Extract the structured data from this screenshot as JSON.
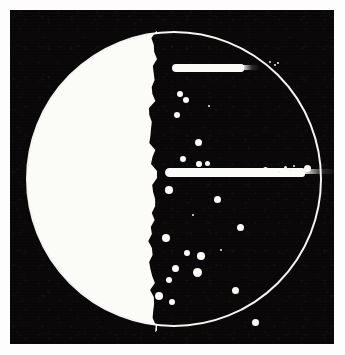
{
  "image": {
    "kind": "photograph",
    "subject": "microbiology culture plate",
    "description": "Black-and-white photograph of a circular culture plate showing a confluent white bacterial lawn over the left half, two horizontal inoculation streaks, and numerous discrete round colonies scattered across the clear right half.",
    "background_color": "#fdfdfd",
    "field_color": "#090707",
    "growth_color": "#fbfbf8",
    "rim_color": "#f4f4f0"
  },
  "frame": {
    "left": 10,
    "top": 10,
    "width": 324,
    "height": 334
  },
  "dish": {
    "center_x": 164,
    "center_y": 169,
    "radius": 148,
    "rim_thickness": 2.5
  },
  "confluent_lawn": {
    "label": "confluent growth",
    "left_edge_x": 16,
    "right_edge_x": 147,
    "top_y": 16,
    "bottom_y": 322
  },
  "streaks": [
    {
      "name": "upper-streak",
      "x": 162,
      "y": 54,
      "width": 72,
      "height": 8,
      "taper_width": 18
    },
    {
      "name": "middle-streak",
      "x": 155,
      "y": 158,
      "width": 140,
      "height": 9,
      "taper_width": 34
    }
  ],
  "colonies": [
    {
      "x": 23,
      "y": 84,
      "d": 6.5
    },
    {
      "x": 29,
      "y": 90,
      "d": 6.0
    },
    {
      "x": 20,
      "y": 105,
      "d": 6.5
    },
    {
      "x": 41,
      "y": 132,
      "d": 7.0
    },
    {
      "x": 26,
      "y": 149,
      "d": 6.5
    },
    {
      "x": 42,
      "y": 154,
      "d": 5.5
    },
    {
      "x": 50,
      "y": 153,
      "d": 5.0
    },
    {
      "x": 12,
      "y": 180,
      "d": 7.5
    },
    {
      "x": 60,
      "y": 189,
      "d": 7.0
    },
    {
      "x": 83,
      "y": 217,
      "d": 7.0
    },
    {
      "x": 9,
      "y": 228,
      "d": 8.5
    },
    {
      "x": 30,
      "y": 243,
      "d": 6.5
    },
    {
      "x": 44,
      "y": 246,
      "d": 7.5
    },
    {
      "x": 18,
      "y": 258,
      "d": 7.0
    },
    {
      "x": 40,
      "y": 262,
      "d": 9.0
    },
    {
      "x": 12,
      "y": 270,
      "d": 6.0
    },
    {
      "x": 2,
      "y": 286,
      "d": 8.0
    },
    {
      "x": 15,
      "y": 292,
      "d": 6.0
    },
    {
      "x": 78,
      "y": 280,
      "d": 7.0
    },
    {
      "x": 98,
      "y": 312,
      "d": 7.0
    },
    {
      "x": 144,
      "y": 161,
      "d": 6.5
    },
    {
      "x": 150,
      "y": 158,
      "d": 7.0
    },
    {
      "x": 108,
      "y": 159,
      "d": 5.0
    }
  ],
  "specks": [
    {
      "x": 113,
      "y": 52,
      "d": 2.5
    },
    {
      "x": 118,
      "y": 55,
      "d": 2.0
    },
    {
      "x": 121,
      "y": 53,
      "d": 1.8
    },
    {
      "x": 128,
      "y": 157,
      "d": 3.0
    },
    {
      "x": 133,
      "y": 160,
      "d": 2.2
    },
    {
      "x": 137,
      "y": 156,
      "d": 2.0
    },
    {
      "x": 122,
      "y": 162,
      "d": 2.4
    },
    {
      "x": 52,
      "y": 96,
      "d": 2.0
    },
    {
      "x": 36,
      "y": 205,
      "d": 2.2
    },
    {
      "x": 64,
      "y": 240,
      "d": 2.0
    }
  ]
}
